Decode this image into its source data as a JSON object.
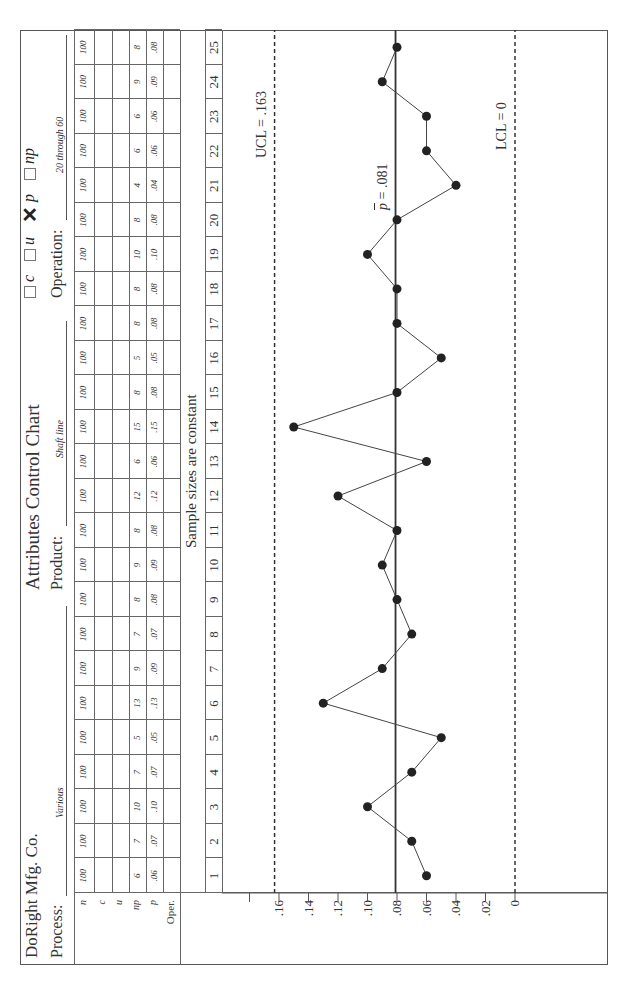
{
  "header": {
    "company": "DoRight Mfg. Co.",
    "title": "Attributes Control Chart",
    "process_label": "Process:",
    "process_value": "Various",
    "product_label": "Product:",
    "product_value": "Shaft line",
    "operation_label": "Operation:",
    "operation_value": "20 through 60",
    "chart_types": [
      {
        "label": "c",
        "checked": false
      },
      {
        "label": "u",
        "checked": false
      },
      {
        "label": "p",
        "checked": true
      },
      {
        "label": "np",
        "checked": false
      }
    ]
  },
  "table": {
    "row_labels": [
      "n",
      "c",
      "u",
      "np",
      "p",
      "Oper."
    ],
    "n": [
      "100",
      "100",
      "100",
      "100",
      "100",
      "100",
      "100",
      "100",
      "100",
      "100",
      "100",
      "100",
      "100",
      "100",
      "100",
      "100",
      "100",
      "100",
      "100",
      "100",
      "100",
      "100",
      "100",
      "100",
      "100"
    ],
    "np": [
      "6",
      "7",
      "10",
      "7",
      "5",
      "13",
      "9",
      "7",
      "8",
      "9",
      "8",
      "12",
      "6",
      "15",
      "8",
      "5",
      "8",
      "8",
      "10",
      "8",
      "4",
      "6",
      "6",
      "9",
      "8"
    ],
    "p": [
      ".06",
      ".07",
      ".10",
      ".07",
      ".05",
      ".13",
      ".09",
      ".07",
      ".08",
      ".09",
      ".08",
      ".12",
      ".06",
      ".15",
      ".08",
      ".05",
      ".08",
      ".08",
      ".10",
      ".08",
      ".04",
      ".06",
      ".06",
      ".09",
      ".08"
    ]
  },
  "subgroups": [
    "1",
    "2",
    "3",
    "4",
    "5",
    "6",
    "7",
    "8",
    "9",
    "10",
    "11",
    "12",
    "13",
    "14",
    "15",
    "16",
    "17",
    "18",
    "19",
    "20",
    "21",
    "22",
    "23",
    "24",
    "25"
  ],
  "note": "Sample sizes are constant",
  "axis": {
    "ticks": [
      ".16",
      ".14",
      ".12",
      ".10",
      ".08",
      ".06",
      ".04",
      ".02",
      "0"
    ]
  },
  "control_limits": {
    "ucl_label": "UCL = .163",
    "center_label_symbol": "p",
    "center_label_value": " = .081",
    "lcl_label": "LCL = 0"
  },
  "chart_data": {
    "type": "line",
    "xlabel": "Subgroup",
    "ylabel": "p (fraction nonconforming)",
    "x": [
      1,
      2,
      3,
      4,
      5,
      6,
      7,
      8,
      9,
      10,
      11,
      12,
      13,
      14,
      15,
      16,
      17,
      18,
      19,
      20,
      21,
      22,
      23,
      24,
      25
    ],
    "series": [
      {
        "name": "p",
        "values": [
          0.06,
          0.07,
          0.1,
          0.07,
          0.05,
          0.13,
          0.09,
          0.07,
          0.08,
          0.09,
          0.08,
          0.12,
          0.06,
          0.15,
          0.08,
          0.05,
          0.08,
          0.08,
          0.1,
          0.08,
          0.04,
          0.06,
          0.06,
          0.09,
          0.08
        ]
      }
    ],
    "np": [
      6,
      7,
      10,
      7,
      5,
      13,
      9,
      7,
      8,
      9,
      8,
      12,
      6,
      15,
      8,
      5,
      8,
      8,
      10,
      8,
      4,
      6,
      6,
      9,
      8
    ],
    "n": 100,
    "control_limits": {
      "UCL": 0.163,
      "center": 0.081,
      "LCL": 0
    },
    "ylim": [
      0,
      0.18
    ],
    "yticks": [
      0,
      0.02,
      0.04,
      0.06,
      0.08,
      0.1,
      0.12,
      0.14,
      0.16
    ],
    "grid": false,
    "annotations": [
      "Sample sizes are constant",
      "UCL = .163",
      "p̄ = .081",
      "LCL = 0"
    ]
  }
}
